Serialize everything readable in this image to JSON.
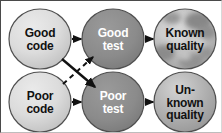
{
  "diagram": {
    "type": "flow-diagram",
    "nodes": [
      {
        "id": "good-code",
        "label": "Good\ncode",
        "lines": [
          "Good",
          "code"
        ],
        "fill": "#d6d6d6",
        "stroke": "#4f4f4f",
        "text_color": "#111111",
        "style": "light-gradient",
        "cx": 39,
        "cy": 38,
        "rx": 32,
        "ry": 31
      },
      {
        "id": "good-test",
        "label": "Good\ntest",
        "lines": [
          "Good",
          "test"
        ],
        "fill": "#8a8a8a",
        "stroke": "#4f4f4f",
        "text_color": "#ffffff",
        "style": "dark-solid",
        "cx": 112,
        "cy": 38,
        "rx": 32,
        "ry": 31
      },
      {
        "id": "known-quality",
        "label": "Known\nquality",
        "lines": [
          "Known",
          "quality"
        ],
        "fill": "#b8b8b8",
        "stroke": "#4f4f4f",
        "text_color": "#111111",
        "style": "mottled-texture",
        "cx": 184,
        "cy": 38,
        "rx": 32,
        "ry": 31
      },
      {
        "id": "poor-code",
        "label": "Poor\ncode",
        "lines": [
          "Poor",
          "code"
        ],
        "fill": "#d6d6d6",
        "stroke": "#4f4f4f",
        "text_color": "#111111",
        "style": "light-gradient",
        "cx": 39,
        "cy": 101,
        "rx": 32,
        "ry": 31
      },
      {
        "id": "poor-test",
        "label": "Poor\ntest",
        "lines": [
          "Poor",
          "test"
        ],
        "fill": "#8a8a8a",
        "stroke": "#4f4f4f",
        "text_color": "#ffffff",
        "style": "dark-solid",
        "cx": 112,
        "cy": 101,
        "rx": 32,
        "ry": 31
      },
      {
        "id": "unknown-quality",
        "label": "Un-\nknown\nquality",
        "lines": [
          "Un-",
          "known",
          "quality"
        ],
        "fill": "#b0b0b0",
        "stroke": "#4f4f4f",
        "text_color": "#111111",
        "style": "gray-gradient",
        "cx": 184,
        "cy": 101,
        "rx": 32,
        "ry": 31
      }
    ],
    "edges": [
      {
        "id": "good-code-to-good-test",
        "from": "good-code",
        "to": "good-test",
        "line_style": "solid",
        "direction": "horizontal",
        "color": "#111111"
      },
      {
        "id": "good-test-to-known-quality",
        "from": "good-test",
        "to": "known-quality",
        "line_style": "solid",
        "direction": "horizontal",
        "color": "#111111"
      },
      {
        "id": "poor-code-to-poor-test",
        "from": "poor-code",
        "to": "poor-test",
        "line_style": "solid",
        "direction": "horizontal",
        "color": "#111111"
      },
      {
        "id": "poor-test-to-unknown-quality",
        "from": "poor-test",
        "to": "unknown-quality",
        "line_style": "solid",
        "direction": "horizontal",
        "color": "#111111"
      },
      {
        "id": "good-code-to-poor-test",
        "from": "good-code",
        "to": "poor-test",
        "line_style": "solid",
        "direction": "diagonal-down",
        "color": "#111111"
      },
      {
        "id": "poor-code-to-good-test",
        "from": "poor-code",
        "to": "good-test",
        "line_style": "dashed",
        "direction": "diagonal-up",
        "color": "#111111"
      }
    ],
    "colors": {
      "background": "#ffffff",
      "border": "#4a4a4a",
      "light_node": "#d6d6d6",
      "dark_node": "#8a8a8a",
      "outcome_node": "#b8b8b8",
      "arrow": "#111111"
    }
  }
}
